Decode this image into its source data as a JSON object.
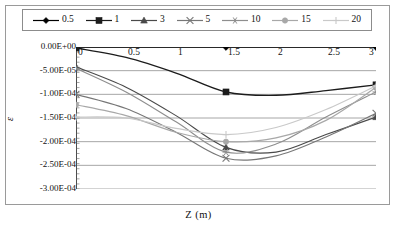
{
  "figure": {
    "xlabel": "Z (m)",
    "ylabel": "ε"
  },
  "legend": {
    "position": "top",
    "entries": [
      {
        "label": "0.5",
        "marker": "diamond",
        "color": "#000000"
      },
      {
        "label": "1",
        "marker": "square",
        "color": "#1c1c1c"
      },
      {
        "label": "3",
        "marker": "triangle",
        "color": "#4a4a4a"
      },
      {
        "label": "5",
        "marker": "cross",
        "color": "#777777"
      },
      {
        "label": "10",
        "marker": "asterisk",
        "color": "#8e8e8e"
      },
      {
        "label": "15",
        "marker": "circle",
        "color": "#a8a8a8"
      },
      {
        "label": "20",
        "marker": "plus",
        "color": "#c9c9c9"
      }
    ]
  },
  "axes": {
    "y_ticks": [
      "0.00E+00",
      "-5.00E-05",
      "-1.00E-04",
      "-1.50E-04",
      "-2.00E-04",
      "-2.50E-04",
      "-3.00E-04"
    ],
    "x_ticks": [
      "0",
      "0.5",
      "1",
      "1.5",
      "2",
      "2.5",
      "3"
    ]
  },
  "chart_data": {
    "type": "line",
    "title": "",
    "xlabel": "Z (m)",
    "ylabel": "ε",
    "xlim": [
      0,
      3
    ],
    "ylim": [
      -0.0003,
      0.0
    ],
    "grid": true,
    "legend_position": "top",
    "x": [
      0,
      0.5,
      1,
      1.5,
      2,
      2.5,
      3
    ],
    "series": [
      {
        "name": "0.5",
        "marker": "diamond",
        "color": "#000000",
        "values": [
          0,
          0,
          0,
          0,
          0,
          0,
          0
        ]
      },
      {
        "name": "1",
        "marker": "square",
        "color": "#1c1c1c",
        "values": [
          -2e-06,
          -2.2e-05,
          -5.5e-05,
          -9.5e-05,
          -0.000102,
          -9.2e-05,
          -8e-05
        ]
      },
      {
        "name": "3",
        "marker": "triangle",
        "color": "#4a4a4a",
        "values": [
          -4.2e-05,
          -8.5e-05,
          -0.000145,
          -0.000212,
          -0.000222,
          -0.000185,
          -0.000148
        ]
      },
      {
        "name": "5",
        "marker": "cross",
        "color": "#777777",
        "values": [
          -0.0001,
          -0.00013,
          -0.00018,
          -0.000235,
          -0.00023,
          -0.00019,
          -0.00014
        ]
      },
      {
        "name": "10",
        "marker": "asterisk",
        "color": "#8e8e8e",
        "values": [
          -4.5e-05,
          -9.5e-05,
          -0.000158,
          -0.000222,
          -0.000205,
          -0.000148,
          -9.5e-05
        ]
      },
      {
        "name": "15",
        "marker": "circle",
        "color": "#a8a8a8",
        "values": [
          -0.000122,
          -0.000145,
          -0.00018,
          -0.0002,
          -0.000192,
          -0.000155,
          -8.5e-05
        ]
      },
      {
        "name": "20",
        "marker": "plus",
        "color": "#c9c9c9",
        "values": [
          -0.000148,
          -0.00015,
          -0.000172,
          -0.000185,
          -0.00017,
          -0.000132,
          -8.2e-05
        ]
      }
    ]
  }
}
